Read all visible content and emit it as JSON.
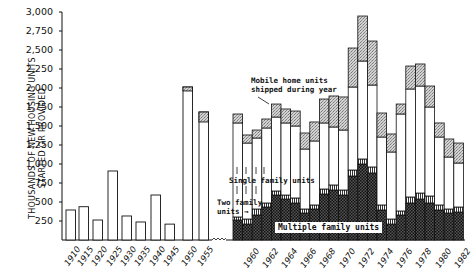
{
  "chart_data": {
    "type": "bar",
    "title": "",
    "ylabel": "THOUSANDS OF NEW HOUSING UNITS STARTED OR PROVIDED",
    "ylabel_lines": [
      "THOUSANDS OF NEW HOUSING UNITS",
      "STARTED OR PROVIDED"
    ],
    "xlabel": "",
    "ylim": [
      0,
      3000
    ],
    "yticks": [
      250,
      500,
      750,
      1000,
      1250,
      1500,
      1750,
      2000,
      2250,
      2500,
      2750,
      3000
    ],
    "ytick_labels": [
      "250",
      "500",
      "750",
      "1,000",
      "1,250",
      "1,500",
      "1,750",
      "2,000",
      "2,250",
      "2,500",
      "2,750",
      "3,000"
    ],
    "grid": false,
    "axis_break_after": "1955",
    "early_period": {
      "categories": [
        "1910",
        "1915",
        "1920",
        "1925",
        "1930",
        "1935",
        "1940",
        "1945",
        "1950",
        "1955"
      ],
      "total": [
        395,
        438,
        263,
        908,
        316,
        237,
        592,
        209,
        2013,
        1684
      ],
      "mobile_home_cap": [
        0,
        0,
        0,
        0,
        0,
        0,
        0,
        0,
        52,
        131
      ]
    },
    "stacked_period": {
      "categories": [
        "1959",
        "1960",
        "1961",
        "1962",
        "1963",
        "1964",
        "1965",
        "1966",
        "1967",
        "1968",
        "1969",
        "1970",
        "1971",
        "1972",
        "1973",
        "1974",
        "1975",
        "1976",
        "1977",
        "1978",
        "1979",
        "1980",
        "1981",
        "1982"
      ],
      "x_tick_labels": [
        "1960",
        "1962",
        "1964",
        "1966",
        "1968",
        "1970",
        "1972",
        "1974",
        "1976",
        "1978",
        "1980",
        "1982"
      ],
      "series": [
        {
          "name": "Multiple family units",
          "pattern": "dark-checker",
          "values": [
            263,
            210,
            329,
            434,
            592,
            539,
            487,
            355,
            408,
            605,
            658,
            592,
            842,
            1000,
            882,
            395,
            210,
            329,
            487,
            539,
            487,
            395,
            355,
            368
          ]
        },
        {
          "name": "Two family units",
          "pattern": "hatched",
          "values": [
            40,
            66,
            79,
            53,
            53,
            53,
            66,
            53,
            53,
            66,
            66,
            66,
            79,
            66,
            79,
            66,
            66,
            53,
            79,
            79,
            92,
            66,
            53,
            66
          ]
        },
        {
          "name": "Single family units",
          "pattern": "white",
          "values": [
            1237,
            1000,
            934,
            987,
            973,
            948,
            947,
            789,
            842,
            869,
            763,
            789,
            1092,
            1289,
            1078,
            894,
            882,
            1276,
            1421,
            1408,
            1171,
            894,
            684,
            579
          ]
        },
        {
          "name": "Mobile home units shipped during year",
          "pattern": "stipple",
          "values": [
            118,
            106,
            105,
            118,
            171,
            184,
            197,
            211,
            250,
            315,
            408,
            435,
            513,
            592,
            579,
            316,
            237,
            131,
            302,
            290,
            276,
            185,
            237,
            263
          ]
        }
      ],
      "totals": [
        1658,
        1382,
        1447,
        1592,
        1789,
        1724,
        1697,
        1408,
        1553,
        1855,
        1895,
        1882,
        2526,
        2947,
        2618,
        1671,
        1395,
        1789,
        2289,
        2316,
        2026,
        1540,
        1329,
        1276
      ]
    },
    "annotations": [
      {
        "text": "Mobile home units shipped during year",
        "lines": [
          "Mobile home units",
          "shipped during year"
        ]
      },
      {
        "text": "Single family units"
      },
      {
        "text": "Two family units",
        "lines": [
          "Two family",
          "units →"
        ]
      },
      {
        "text": "Multiple family units"
      }
    ],
    "legend": "inline annotations"
  },
  "labels": {
    "y_line1": "THOUSANDS OF NEW HOUSING UNITS",
    "y_line2": "STARTED OR PROVIDED",
    "mobile_1": "Mobile home units",
    "mobile_2": "shipped during year",
    "single": "Single family units",
    "two_1": "Two family",
    "two_2": "units →",
    "multiple": "Multiple family units"
  },
  "colors": {
    "ink": "#1a1a1a",
    "dark_fill": "#3a3a3a",
    "stipple": "#c8c8c8",
    "background": "#ffffff"
  }
}
